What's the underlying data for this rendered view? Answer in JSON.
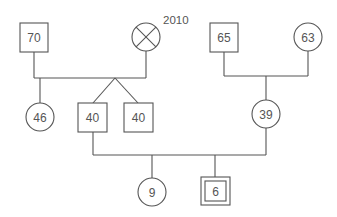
{
  "diagram": {
    "type": "pedigree",
    "colors": {
      "line": "#555555",
      "background": "#ffffff"
    },
    "individuals": [
      {
        "id": "gf_paternal",
        "sex": "male",
        "shape": "square",
        "label": "70"
      },
      {
        "id": "gm_paternal",
        "sex": "female",
        "shape": "circle-cross",
        "status": "deceased",
        "label": "",
        "annotation": "2010"
      },
      {
        "id": "gf_maternal",
        "sex": "male",
        "shape": "square",
        "label": "65"
      },
      {
        "id": "gm_maternal",
        "sex": "female",
        "shape": "circle",
        "label": "63"
      },
      {
        "id": "aunt",
        "sex": "female",
        "shape": "circle",
        "label": "46"
      },
      {
        "id": "father",
        "sex": "male",
        "shape": "square",
        "label": "40",
        "twin": true
      },
      {
        "id": "uncle_twin",
        "sex": "male",
        "shape": "square",
        "label": "40",
        "twin": true
      },
      {
        "id": "mother",
        "sex": "female",
        "shape": "circle",
        "label": "39"
      },
      {
        "id": "sister",
        "sex": "female",
        "shape": "circle",
        "label": "9"
      },
      {
        "id": "proband",
        "sex": "male",
        "shape": "double-square",
        "label": "6"
      }
    ]
  }
}
